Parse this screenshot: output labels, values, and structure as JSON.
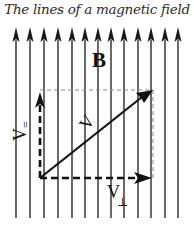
{
  "title": "The lines of a magnetic field",
  "labels": {
    "field": "B",
    "velocity": "V",
    "parallel": "V",
    "parallel_sub": "=",
    "perpendicular": "V",
    "perpendicular_sub": "⊥"
  },
  "field_lines_x": [
    16,
    30,
    44,
    58,
    72,
    85,
    98,
    111,
    124,
    138,
    151,
    165,
    178
  ],
  "colors": {
    "line": "#1a1a1a",
    "dash_box": "#888888"
  }
}
